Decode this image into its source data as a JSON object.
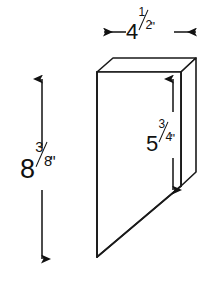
{
  "drawing": {
    "title": "Beveled panel isometric dimension drawing",
    "background_color": "#ffffff",
    "line_color": "#1a1a1a",
    "face_fill": "#ffffff",
    "dimensions": {
      "width": {
        "label": "4½\"",
        "whole": "4",
        "numerator": "1",
        "denominator": "2",
        "unit": "\"",
        "name": "width",
        "orientation": "horizontal",
        "position": "top"
      },
      "height": {
        "label": "8⅜\"",
        "whole": "8",
        "numerator": "3",
        "denominator": "8",
        "unit": "\"",
        "name": "overall-height",
        "orientation": "vertical",
        "position": "left"
      },
      "right_height": {
        "label": "5¾\"",
        "whole": "5",
        "numerator": "3",
        "denominator": "4",
        "unit": "\"",
        "name": "right-edge-height",
        "orientation": "vertical",
        "position": "right-inner"
      }
    },
    "geometry": {
      "front_face": "97,72 181,72 181,186 97,257",
      "top_face": "97,72 113,58 196,58 181,72",
      "side_face": "181,72 196,58 196,172 181,186",
      "diagonal_cut": "97,257 181,186"
    }
  }
}
